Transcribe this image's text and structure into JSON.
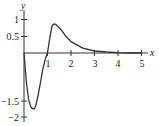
{
  "chart_data": {
    "type": "line",
    "title": "",
    "xlabel": "x",
    "ylabel": "y",
    "xlim": [
      0,
      5.3
    ],
    "ylim": [
      -2.2,
      1.2
    ],
    "x_ticks": [
      "1",
      "2",
      "3",
      "4",
      "5"
    ],
    "y_ticks": [
      "1",
      "0.5",
      "-1.5",
      "-2"
    ],
    "grid": false,
    "legend": null,
    "series": [
      {
        "name": "curve",
        "x": [
          0,
          0.1,
          0.2,
          0.3,
          0.4,
          0.45,
          0.5,
          0.6,
          0.7,
          0.8,
          0.9,
          1.0,
          1.1,
          1.2,
          1.3,
          1.4,
          1.6,
          1.8,
          2.0,
          2.5,
          3.0,
          3.5,
          4.0,
          4.5,
          5.0
        ],
        "y": [
          0,
          -0.9,
          -1.45,
          -1.68,
          -1.72,
          -1.7,
          -1.62,
          -1.3,
          -0.9,
          -0.5,
          -0.2,
          0.0,
          0.5,
          0.85,
          0.9,
          0.85,
          0.7,
          0.5,
          0.35,
          0.15,
          0.06,
          0.03,
          0.01,
          0.0,
          0.0
        ]
      }
    ]
  },
  "labels": {
    "x_axis": "x",
    "y_axis": "y",
    "xtick_1": "1",
    "xtick_2": "2",
    "xtick_3": "3",
    "xtick_4": "4",
    "xtick_5": "5",
    "ytick_1": "1",
    "ytick_05": "0.5",
    "ytick_m15": "−1.5",
    "ytick_m2": "−2"
  }
}
